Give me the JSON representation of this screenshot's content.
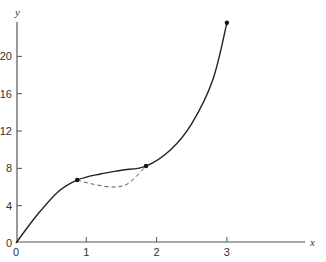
{
  "chart_data": {
    "type": "line",
    "title": "",
    "xlabel": "x",
    "ylabel": "y",
    "xlim": [
      0,
      4.1
    ],
    "ylim": [
      0,
      24
    ],
    "x_ticks": [
      "0",
      "1",
      "2",
      "3"
    ],
    "y_ticks": [
      "0",
      "4",
      "8",
      "12",
      "16",
      "20"
    ],
    "grid": false,
    "legend": "none",
    "series": [
      {
        "name": "solid curve",
        "style": "solid",
        "points": [
          [
            0,
            0
          ],
          [
            0.3,
            3.0
          ],
          [
            0.6,
            5.5
          ],
          [
            0.87,
            6.75
          ],
          [
            1.2,
            7.4
          ],
          [
            1.5,
            7.8
          ],
          [
            1.85,
            8.25
          ],
          [
            2.2,
            10.0
          ],
          [
            2.5,
            12.8
          ],
          [
            2.8,
            17.5
          ],
          [
            3.0,
            23.6
          ]
        ]
      },
      {
        "name": "dashed curve",
        "style": "dashed",
        "points": [
          [
            0.87,
            6.75
          ],
          [
            1.1,
            6.3
          ],
          [
            1.38,
            6.0
          ],
          [
            1.6,
            6.4
          ],
          [
            1.85,
            8.25
          ]
        ]
      }
    ],
    "marked_points": [
      [
        0.87,
        6.75
      ],
      [
        1.85,
        8.25
      ],
      [
        3.0,
        23.6
      ]
    ]
  }
}
